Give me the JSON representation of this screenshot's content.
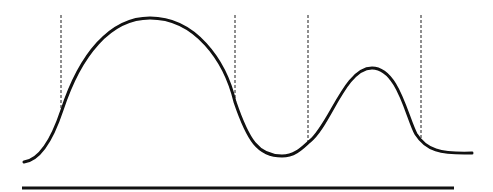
{
  "diagram": {
    "colors": {
      "background": "#ffffff",
      "stroke": "#111111",
      "dashed": "#444444"
    },
    "curve": {
      "path": "M24,162 C40,160 52,140 62,110 C80,55 110,18 150,18 C195,18 225,60 235,102 C248,140 258,156 282,156 C296,156 304,146 310,141 C330,125 345,68 372,68 C398,68 407,118 416,134 C426,150 440,154 472,153",
      "peaks": [
        {
          "x": 150,
          "y": 18
        },
        {
          "x": 372,
          "y": 68
        }
      ]
    },
    "markers": [
      {
        "x": 61,
        "y1": 15,
        "y2": 110
      },
      {
        "x": 235,
        "y1": 15,
        "y2": 102
      },
      {
        "x": 308,
        "y1": 15,
        "y2": 142
      },
      {
        "x": 421,
        "y1": 15,
        "y2": 138
      }
    ],
    "baseline": {
      "x1": 22,
      "x2": 454,
      "y": 188
    }
  }
}
